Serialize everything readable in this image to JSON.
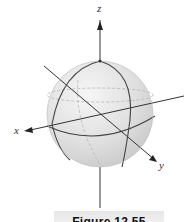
{
  "figure": {
    "type": "3d-sphere-with-axes",
    "axes": {
      "x_label": "x",
      "y_label": "y",
      "z_label": "z"
    },
    "colors": {
      "sphere_fill": "#e3e3e3",
      "lines": "#444444",
      "axes": "#333333",
      "hidden_lines": "#b0b0b0"
    },
    "caption": "Figure 12.55"
  }
}
